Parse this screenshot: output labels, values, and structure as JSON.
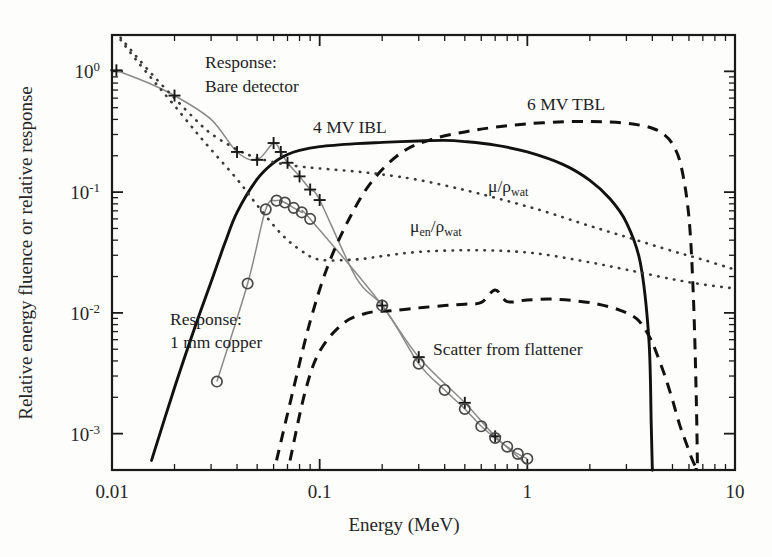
{
  "figure": {
    "background_color": "#fdfdfc",
    "ink_color": "#111111"
  },
  "chart_data": {
    "type": "line",
    "title": "",
    "xlabel": "Energy (MeV)",
    "ylabel": "Relative energy fluence or relative response",
    "xscale": "log",
    "yscale": "log",
    "xlim": [
      0.01,
      10
    ],
    "ylim": [
      0.0005,
      2.0
    ],
    "grid": false,
    "legend_position": "inline-annotations",
    "xticks": [
      "0.01",
      "0.1",
      "1",
      "10"
    ],
    "xtick_values": [
      0.01,
      0.1,
      1,
      10
    ],
    "yticks": [
      "10^0",
      "10^-1",
      "10^-2",
      "10^-3"
    ],
    "ytick_values": [
      1,
      0.1,
      0.01,
      0.001
    ],
    "ytick_mantissa": "10",
    "ytick_exponents": [
      "0",
      "-1",
      "-2",
      "-3"
    ],
    "series": [
      {
        "name": "Response: Bare detector",
        "style": "line-with-plus-markers",
        "label": "Response:\nBare detector",
        "label_line1": "Response:",
        "label_line2": "Bare detector",
        "x": [
          0.0105,
          0.015,
          0.02,
          0.03,
          0.04,
          0.05,
          0.06,
          0.065,
          0.07,
          0.08,
          0.09,
          0.1,
          0.15,
          0.2,
          0.3,
          0.5,
          0.7,
          1.0
        ],
        "y": [
          1.02,
          0.8,
          0.63,
          0.4,
          0.215,
          0.185,
          0.255,
          0.215,
          0.175,
          0.135,
          0.105,
          0.086,
          0.0195,
          0.0115,
          0.0043,
          0.0018,
          0.00095,
          0.00055
        ],
        "markers_x": [
          0.0105,
          0.02,
          0.04,
          0.05,
          0.06,
          0.065,
          0.07,
          0.08,
          0.09,
          0.1,
          0.2,
          0.3,
          0.5,
          0.7
        ],
        "markers_y": [
          1.02,
          0.63,
          0.215,
          0.185,
          0.255,
          0.215,
          0.175,
          0.135,
          0.105,
          0.086,
          0.0115,
          0.0043,
          0.0018,
          0.00095
        ]
      },
      {
        "name": "Response: 1 mm copper",
        "style": "line-with-circle-markers",
        "label": "Response:\n1 mm copper",
        "label_line1": "Response:",
        "label_line2": "1 mm copper",
        "x": [
          0.032,
          0.045,
          0.055,
          0.062,
          0.068,
          0.075,
          0.082,
          0.09,
          0.2,
          0.3,
          0.4,
          0.5,
          0.6,
          0.7,
          0.8,
          0.9,
          1.0
        ],
        "y": [
          0.0027,
          0.0175,
          0.072,
          0.085,
          0.082,
          0.074,
          0.068,
          0.06,
          0.0115,
          0.0038,
          0.0023,
          0.0016,
          0.00115,
          0.00092,
          0.00078,
          0.00068,
          0.00062
        ],
        "markers_x": [
          0.032,
          0.045,
          0.055,
          0.062,
          0.068,
          0.075,
          0.082,
          0.09,
          0.2,
          0.3,
          0.4,
          0.5,
          0.6,
          0.7,
          0.8,
          0.9,
          1.0
        ],
        "markers_y": [
          0.0027,
          0.0175,
          0.072,
          0.085,
          0.082,
          0.074,
          0.068,
          0.06,
          0.0115,
          0.0038,
          0.0023,
          0.0016,
          0.00115,
          0.00092,
          0.00078,
          0.00068,
          0.00062
        ]
      },
      {
        "name": "4 MV IBL",
        "style": "solid-thick",
        "label": "4 MV IBL",
        "x": [
          0.0155,
          0.02,
          0.025,
          0.03,
          0.035,
          0.04,
          0.05,
          0.06,
          0.07,
          0.08,
          0.1,
          0.15,
          0.2,
          0.3,
          0.4,
          0.5,
          0.7,
          1.0,
          1.5,
          2.0,
          2.5,
          3.0,
          3.5,
          3.85,
          3.95,
          4.0
        ],
        "y": [
          0.0006,
          0.0024,
          0.0075,
          0.018,
          0.038,
          0.068,
          0.128,
          0.175,
          0.205,
          0.222,
          0.238,
          0.252,
          0.258,
          0.265,
          0.268,
          0.262,
          0.245,
          0.215,
          0.168,
          0.125,
          0.088,
          0.056,
          0.026,
          0.006,
          0.0012,
          0.0005
        ]
      },
      {
        "name": "6 MV TBL",
        "style": "dashed",
        "label": "6 MV TBL",
        "x": [
          0.062,
          0.075,
          0.09,
          0.11,
          0.14,
          0.18,
          0.25,
          0.35,
          0.5,
          0.7,
          1.0,
          1.5,
          2.0,
          2.5,
          3.0,
          3.5,
          4.0,
          4.5,
          5.0,
          5.5,
          6.0,
          6.3,
          6.5,
          6.6
        ],
        "y": [
          0.0006,
          0.0024,
          0.0085,
          0.025,
          0.062,
          0.125,
          0.215,
          0.275,
          0.315,
          0.345,
          0.368,
          0.382,
          0.385,
          0.38,
          0.372,
          0.358,
          0.338,
          0.305,
          0.25,
          0.165,
          0.062,
          0.014,
          0.0022,
          0.0005
        ]
      },
      {
        "name": "Scatter from flattener",
        "style": "dashed",
        "label": "Scatter from flattener",
        "x": [
          0.072,
          0.085,
          0.1,
          0.13,
          0.17,
          0.22,
          0.3,
          0.4,
          0.5,
          0.6,
          0.7,
          0.8,
          1.0,
          1.3,
          1.7,
          2.2,
          2.8,
          3.4,
          3.9,
          4.2,
          4.6,
          5.0,
          5.4,
          5.8,
          6.2,
          6.5
        ],
        "y": [
          0.0006,
          0.0022,
          0.0048,
          0.0082,
          0.01,
          0.0104,
          0.011,
          0.0115,
          0.0118,
          0.0122,
          0.0155,
          0.0124,
          0.0128,
          0.013,
          0.0126,
          0.0118,
          0.0105,
          0.0088,
          0.0062,
          0.0046,
          0.003,
          0.0019,
          0.0012,
          0.00085,
          0.00062,
          0.00052
        ]
      },
      {
        "name": "mu over rho water",
        "style": "dotted",
        "label": "μ/ρ",
        "label_base": "μ/ρ",
        "label_sub": "wat",
        "x": [
          0.011,
          0.013,
          0.016,
          0.02,
          0.025,
          0.03,
          0.04,
          0.05,
          0.065,
          0.08,
          0.1,
          0.15,
          0.2,
          0.3,
          0.5,
          0.8,
          1.2,
          2.0,
          3.0,
          5.0,
          7.0,
          10.0
        ],
        "y": [
          1.9,
          1.35,
          0.9,
          0.6,
          0.405,
          0.305,
          0.225,
          0.192,
          0.172,
          0.163,
          0.157,
          0.148,
          0.14,
          0.126,
          0.104,
          0.0845,
          0.0695,
          0.0525,
          0.0425,
          0.0325,
          0.0276,
          0.0228
        ]
      },
      {
        "name": "mu en over rho water",
        "style": "dotted",
        "label": "μ_en/ρ",
        "label_base": "μ",
        "label_sub1": "en",
        "label_mid": "/ρ",
        "label_sub2": "wat",
        "x": [
          0.011,
          0.013,
          0.016,
          0.02,
          0.025,
          0.03,
          0.04,
          0.05,
          0.065,
          0.08,
          0.1,
          0.15,
          0.2,
          0.3,
          0.5,
          0.8,
          1.2,
          2.0,
          3.0,
          5.0,
          7.0,
          10.0
        ],
        "y": [
          1.82,
          1.26,
          0.82,
          0.52,
          0.325,
          0.225,
          0.128,
          0.078,
          0.0455,
          0.0335,
          0.0276,
          0.0277,
          0.0295,
          0.032,
          0.033,
          0.0325,
          0.0305,
          0.0262,
          0.0228,
          0.019,
          0.0172,
          0.0159
        ]
      }
    ],
    "annotations": [
      {
        "text": "Response:",
        "x_px": 205,
        "y_px": 68
      },
      {
        "text": "Bare detector",
        "x_px": 205,
        "y_px": 92
      },
      {
        "text": "4 MV IBL",
        "x_px": 313,
        "y_px": 133
      },
      {
        "text": "6 MV TBL",
        "x_px": 527,
        "y_px": 110
      },
      {
        "text": "μ/ρwat",
        "x_px": 488,
        "y_px": 192
      },
      {
        "text": "μen/ρwat",
        "x_px": 410,
        "y_px": 232
      },
      {
        "text": "Response:",
        "x_px": 170,
        "y_px": 325
      },
      {
        "text": "1 mm copper",
        "x_px": 170,
        "y_px": 348
      },
      {
        "text": "Scatter from flattener",
        "x_px": 433,
        "y_px": 355
      }
    ]
  }
}
